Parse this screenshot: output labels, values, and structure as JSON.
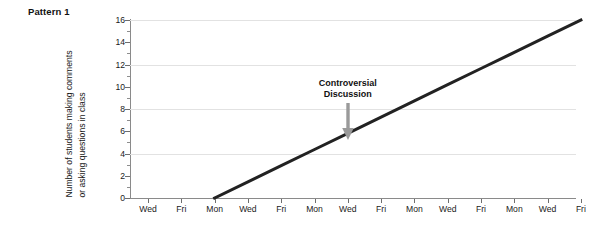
{
  "panel": {
    "title": "Pattern 1"
  },
  "annotation": {
    "line1": "Controversial",
    "line2": "Discussion",
    "arrow_icon": "arrow-down-icon"
  },
  "axes": {
    "ylabel_line1": "Number of students making comments",
    "ylabel_line2": "or asking questions in class",
    "ytick_labels": [
      "0",
      "2",
      "4",
      "6",
      "8",
      "10",
      "12",
      "14",
      "16"
    ],
    "xtick_labels": [
      "Wed",
      "Fri",
      "Mon",
      "Wed",
      "Fri",
      "Mon",
      "Wed",
      "Fri",
      "Mon",
      "Wed",
      "Fri",
      "Mon",
      "Wed",
      "Fri"
    ]
  },
  "style": {
    "line_color": "#222222",
    "grid_color": "#e2e2e2",
    "axis_color": "#8a8a8a",
    "arrow_color": "#9a9a9a",
    "text_color": "#1a1a1a",
    "background": "#ffffff"
  },
  "chart_data": {
    "type": "line",
    "title": "Pattern 1",
    "xlabel": "",
    "ylabel": "Number of students making comments or asking questions in class",
    "categories": [
      "Wed",
      "Fri",
      "Mon",
      "Wed",
      "Fri",
      "Mon",
      "Wed",
      "Fri",
      "Mon",
      "Wed",
      "Fri",
      "Mon",
      "Wed",
      "Fri"
    ],
    "ylim": [
      0,
      16
    ],
    "ytick_values": [
      0,
      2,
      4,
      6,
      8,
      10,
      12,
      14,
      16
    ],
    "y_minor_ticks": [
      1,
      3,
      5,
      7,
      9,
      11,
      13,
      15
    ],
    "gridlines_y": [
      4,
      8,
      12,
      16
    ],
    "grid": "horizontal-major-only",
    "legend": "none",
    "series": [
      {
        "name": "Students making comments or asking questions",
        "x": [
          "Mon",
          "Wed",
          "Fri",
          "Mon",
          "Wed",
          "Fri",
          "Mon",
          "Wed",
          "Fri",
          "Mon",
          "Wed",
          "Fri"
        ],
        "x_index": [
          2,
          3,
          4,
          5,
          6,
          7,
          8,
          9,
          10,
          11,
          12,
          13
        ],
        "values": [
          0,
          1.45,
          2.9,
          4.36,
          5.82,
          7.27,
          8.73,
          10.18,
          11.64,
          13.09,
          14.55,
          16
        ]
      }
    ],
    "annotations": [
      {
        "text": "Controversial Discussion",
        "points_to_category": "Wed",
        "points_to_x_index": 6,
        "points_to_value": 5.8,
        "arrow": "down"
      }
    ]
  }
}
